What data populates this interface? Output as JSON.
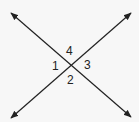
{
  "diagram": {
    "type": "intersecting-lines",
    "background": "#f7f7f7",
    "line_color": "#222222",
    "intersection": {
      "x": 70,
      "y": 65
    },
    "lines": [
      {
        "name": "line-top-left-to-bottom-right",
        "from": {
          "x": 11,
          "y": 13
        },
        "to": {
          "x": 131,
          "y": 117
        },
        "arrows": "both"
      },
      {
        "name": "line-top-right-to-bottom-left",
        "from": {
          "x": 131,
          "y": 13
        },
        "to": {
          "x": 11,
          "y": 118
        },
        "arrows": "both"
      }
    ],
    "labels": {
      "angle_1": "1",
      "angle_2": "2",
      "angle_3": "3",
      "angle_4": "4"
    }
  }
}
